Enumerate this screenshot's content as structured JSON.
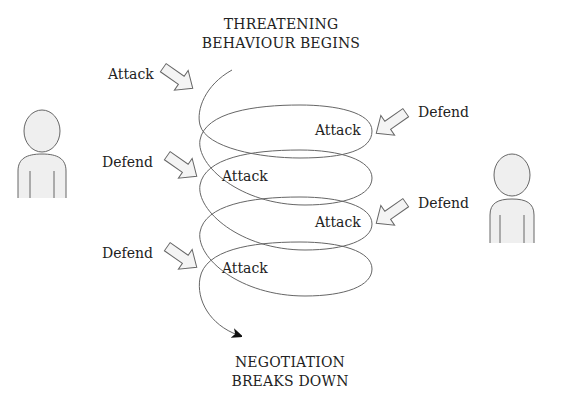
{
  "diagram": {
    "top_title": {
      "line1": "THREATENING",
      "line2": "BEHAVIOUR BEGINS"
    },
    "bottom_title": {
      "line1": "NEGOTIATION",
      "line2": "BREAKS DOWN"
    },
    "left_side_labels": [
      "Attack",
      "Defend",
      "Defend"
    ],
    "right_side_labels": [
      "Defend",
      "Defend"
    ],
    "spiral_labels": [
      "Attack",
      "Attack",
      "Attack",
      "Attack"
    ],
    "colors": {
      "line": "#555555",
      "figure_fill": "#efefef",
      "arrow_fill": "#f2f2f2",
      "text": "#222222"
    },
    "figures": [
      "left-person",
      "right-person"
    ]
  }
}
